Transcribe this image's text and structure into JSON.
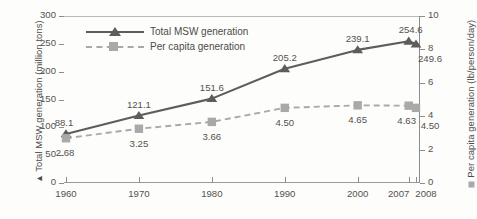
{
  "chart_data": {
    "type": "line",
    "title": "",
    "xlabel": "",
    "categories": [
      "1960",
      "1970",
      "1980",
      "1990",
      "2000",
      "2007",
      "2008"
    ],
    "x_positions": [
      1960,
      1970,
      1980,
      1990,
      2000,
      2007,
      2008
    ],
    "grid": false,
    "legend_position": "upper-left-inside",
    "series": [
      {
        "name": "Total MSW generation",
        "axis": "left",
        "unit": "million tons",
        "marker": "triangle",
        "line_style": "solid",
        "color": "#5f5d5b",
        "values": [
          88.1,
          121.1,
          151.6,
          205.2,
          239.1,
          254.6,
          249.6
        ],
        "labels": [
          "88.1",
          "121.1",
          "151.6",
          "205.2",
          "239.1",
          "254.6",
          "249.6"
        ]
      },
      {
        "name": "Per capita generation",
        "axis": "right",
        "unit": "lb/person/day",
        "marker": "square",
        "line_style": "dashed",
        "color": "#a9a9a9",
        "values": [
          2.68,
          3.25,
          3.66,
          4.5,
          4.65,
          4.63,
          4.5
        ],
        "labels": [
          "2.68",
          "3.25",
          "3.66",
          "4.50",
          "4.65",
          "4.63",
          "4.50"
        ]
      }
    ],
    "axes": {
      "left": {
        "label": "Total MSW generation (million tons)",
        "label_marker": "triangle",
        "ylim": [
          0,
          300
        ],
        "ticks": [
          0,
          50,
          100,
          150,
          200,
          250,
          300
        ],
        "tick_labels": [
          "0",
          "50",
          "100",
          "150",
          "200",
          "250",
          "300"
        ]
      },
      "right": {
        "label": "Per capita generation (lb/person/day)",
        "label_marker": "square",
        "ylim": [
          0,
          10
        ],
        "ticks": [
          0,
          2,
          4,
          6,
          8,
          10
        ],
        "tick_labels": [
          "0",
          "2",
          "4",
          "6",
          "8",
          "10"
        ]
      },
      "bottom": {
        "tick_labels": [
          "1960",
          "1970",
          "1980",
          "1990",
          "2000",
          "2007",
          "2008"
        ]
      }
    }
  },
  "legend": {
    "items": [
      {
        "label": "Total MSW generation"
      },
      {
        "label": "Per capita generation"
      }
    ]
  },
  "axis_titles": {
    "left": "Total MSW generation (million tons)",
    "right": "Per capita generation (lb/person/day)"
  },
  "glyphs": {
    "triangle": "▲",
    "square": "■"
  }
}
